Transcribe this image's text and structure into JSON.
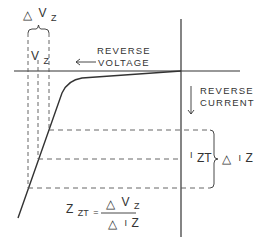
{
  "diagram": {
    "labels": {
      "delta_vz": {
        "prefix": "△",
        "main": "V",
        "sub": "Z"
      },
      "vz": {
        "main": "V",
        "sub": "Z"
      },
      "reverse_voltage": [
        "REVERSE",
        "VOLTAGE"
      ],
      "reverse_current": [
        "REVERSE",
        "CURRENT"
      ],
      "izt": {
        "main": "I",
        "sub": "ZT"
      },
      "delta_iz": {
        "prefix": "△",
        "main": "I",
        "sub": "Z"
      },
      "formula": {
        "lhs_main": "Z",
        "lhs_sub": "ZT",
        "eq": "=",
        "num_prefix": "△",
        "num_main": "V",
        "num_sub": "Z",
        "den_prefix": "△",
        "den_main": "I",
        "den_sub": "Z"
      }
    },
    "colors": {
      "line": "#333333",
      "dashed": "#555555",
      "background": "#ffffff"
    }
  }
}
